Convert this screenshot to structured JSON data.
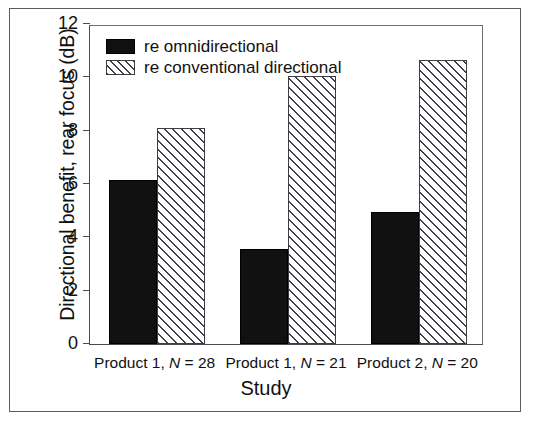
{
  "chart_data": {
    "type": "bar",
    "title": "",
    "xlabel": "Study",
    "ylabel": "Directional benefit, rear focus (dB)",
    "categories": [
      "Product 1, N = 28",
      "Product 1, N = 21",
      "Product 2, N = 20"
    ],
    "category_parts": [
      {
        "prefix": "Product 1, ",
        "italic": "N",
        "suffix": " = 28"
      },
      {
        "prefix": "Product 1, ",
        "italic": "N",
        "suffix": " = 21"
      },
      {
        "prefix": "Product 2, ",
        "italic": "N",
        "suffix": " = 20"
      }
    ],
    "series": [
      {
        "name": "re omnidirectional",
        "pattern": "solid-black",
        "values": [
          6.15,
          3.55,
          4.95
        ]
      },
      {
        "name": "re conventional directional",
        "pattern": "diagonal-hatch",
        "values": [
          8.1,
          10.05,
          10.65
        ]
      }
    ],
    "ylim": [
      0,
      12
    ],
    "ytick_labels": [
      "0",
      "2",
      "4",
      "6",
      "8",
      "10",
      "12"
    ],
    "ytick_values": [
      0,
      2,
      4,
      6,
      8,
      10,
      12
    ],
    "grid": false,
    "legend_position": "top-left inside plot",
    "units": "dB"
  },
  "legend": {
    "items": [
      {
        "label": "re omnidirectional",
        "swatch": "solid-black"
      },
      {
        "label": "re conventional directional",
        "swatch": "diagonal-hatch"
      }
    ]
  },
  "axes": {
    "y_title": "Directional benefit, rear focus (dB)",
    "x_title": "Study"
  },
  "colors": {
    "series_1": "#111111",
    "series_2_hatch": "#40404a",
    "axis": "#4a4a4f",
    "frame": "#5a5a60",
    "background": "#ffffff"
  }
}
